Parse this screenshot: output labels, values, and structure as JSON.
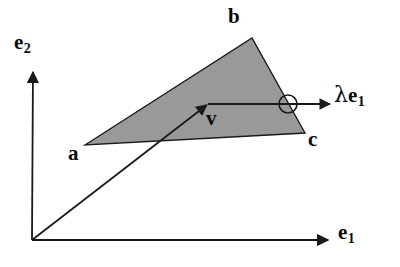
{
  "figure": {
    "background_color": "#ffffff",
    "stroke_color": "#1a1a1a",
    "triangle_fill_color": "#999999",
    "width": 400,
    "height": 267
  },
  "axes": {
    "origin": {
      "x": 32,
      "y": 240
    },
    "e1": {
      "label": "e",
      "subscript": "1",
      "from": {
        "x": 32,
        "y": 240
      },
      "to": {
        "x": 330,
        "y": 240
      },
      "direction": "horizontal-right"
    },
    "e2": {
      "label": "e",
      "subscript": "2",
      "from": {
        "x": 32,
        "y": 240
      },
      "to": {
        "x": 33,
        "y": 70
      },
      "direction": "vertical-up"
    }
  },
  "triangle": {
    "name": "shaded-triangle",
    "fill": "#999999",
    "stroke": "#1a1a1a",
    "vertices": [
      {
        "label": "a",
        "x": 85,
        "y": 145
      },
      {
        "label": "b",
        "x": 252,
        "y": 38
      },
      {
        "label": "c",
        "x": 305,
        "y": 133
      }
    ]
  },
  "vectors": {
    "v": {
      "label": "v",
      "from": {
        "x": 32,
        "y": 240
      },
      "to": {
        "x": 208,
        "y": 104
      }
    },
    "lambda_e1": {
      "lambda": "λ",
      "label": "e",
      "subscript": "1",
      "from": {
        "x": 208,
        "y": 104
      },
      "to": {
        "x": 332,
        "y": 104
      }
    }
  },
  "marker": {
    "name": "intersection-circle",
    "cx": 288,
    "cy": 104,
    "r": 9,
    "stroke": "#1a1a1a",
    "fill": "none"
  }
}
